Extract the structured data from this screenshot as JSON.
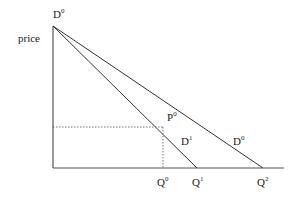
{
  "diagram": {
    "y_axis_label": "price",
    "top_label": {
      "base": "D",
      "sup": "0"
    },
    "price_point": {
      "base": "P",
      "sup": "0"
    },
    "curves": [
      {
        "base": "D",
        "sup": "1"
      },
      {
        "base": "D",
        "sup": "0"
      }
    ],
    "x_labels": [
      {
        "base": "Q",
        "sup": "0"
      },
      {
        "base": "Q",
        "sup": "1"
      },
      {
        "base": "Q",
        "sup": "2"
      }
    ]
  }
}
